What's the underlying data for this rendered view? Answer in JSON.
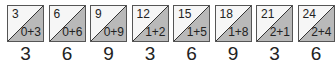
{
  "colors": {
    "light": "#f6f6f6",
    "shade": "#b9b9b9",
    "border": "#555555",
    "text": "#222222"
  },
  "cells": [
    {
      "multiple": "3",
      "digit_sum": "0+3",
      "digital_root": "3"
    },
    {
      "multiple": "6",
      "digit_sum": "0+6",
      "digital_root": "6"
    },
    {
      "multiple": "9",
      "digit_sum": "0+9",
      "digital_root": "9"
    },
    {
      "multiple": "12",
      "digit_sum": "1+2",
      "digital_root": "3"
    },
    {
      "multiple": "15",
      "digit_sum": "1+5",
      "digital_root": "6"
    },
    {
      "multiple": "18",
      "digit_sum": "1+8",
      "digital_root": "9"
    },
    {
      "multiple": "21",
      "digit_sum": "2+1",
      "digital_root": "3"
    },
    {
      "multiple": "24",
      "digit_sum": "2+4",
      "digital_root": "6"
    }
  ]
}
